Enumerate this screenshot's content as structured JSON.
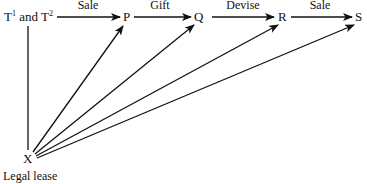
{
  "diagram": {
    "nodes": {
      "origin": {
        "label": "T",
        "sup1": "1",
        "and": " and T",
        "sup2": "2"
      },
      "p": {
        "label": "P"
      },
      "q": {
        "label": "Q"
      },
      "r": {
        "label": "R"
      },
      "s": {
        "label": "S"
      },
      "x": {
        "label": "X",
        "caption": "Legal lease"
      }
    },
    "edges": [
      {
        "from": "T1 and T2",
        "to": "P",
        "label": "Sale"
      },
      {
        "from": "P",
        "to": "Q",
        "label": "Gift"
      },
      {
        "from": "Q",
        "to": "R",
        "label": "Devise"
      },
      {
        "from": "R",
        "to": "S",
        "label": "Sale"
      }
    ],
    "lease_edges": [
      {
        "from": "X",
        "to": "P"
      },
      {
        "from": "X",
        "to": "Q"
      },
      {
        "from": "X",
        "to": "R"
      },
      {
        "from": "X",
        "to": "S"
      }
    ],
    "colors": {
      "line": "#111111",
      "background": "#ffffff"
    }
  }
}
